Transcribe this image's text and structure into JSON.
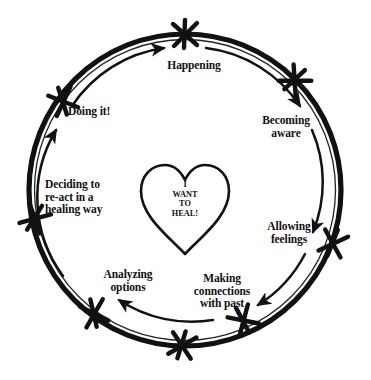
{
  "diagram": {
    "center": {
      "shape": "heart-outline",
      "text": "I\nWANT\nTO\nHEAL!",
      "lines": [
        "I",
        "WANT",
        "TO",
        "HEAL!"
      ]
    },
    "colors": {
      "ink": "#111111",
      "background": "#ffffff"
    },
    "flow_direction": "clockwise",
    "marker_glyph": "hand-drawn-asterisk-star",
    "nodes": [
      {
        "id": "happening",
        "label": "Happening",
        "lines": [
          "Happening"
        ],
        "angle_deg": 270
      },
      {
        "id": "becoming",
        "label": "Becoming aware",
        "lines": [
          "Becoming",
          "aware"
        ],
        "angle_deg": 315
      },
      {
        "id": "allowing",
        "label": "Allowing feelings",
        "lines": [
          "Allowing",
          "feelings"
        ],
        "angle_deg": 0
      },
      {
        "id": "making",
        "label": "Making connections with past",
        "lines": [
          "Making",
          "connections",
          "with past"
        ],
        "angle_deg": 45
      },
      {
        "id": "analyzing",
        "label": "Analyzing options",
        "lines": [
          "Analyzing",
          "options"
        ],
        "angle_deg": 135
      },
      {
        "id": "deciding",
        "label": "Deciding to re-act in a healing way",
        "lines": [
          "Deciding to",
          "re-act in a",
          "healing way"
        ],
        "angle_deg": 180
      },
      {
        "id": "doing",
        "label": "Doing it!",
        "lines": [
          "Doing it!"
        ],
        "angle_deg": 225
      },
      {
        "id": "bottom",
        "label": "",
        "lines": [],
        "angle_deg": 90
      }
    ]
  }
}
